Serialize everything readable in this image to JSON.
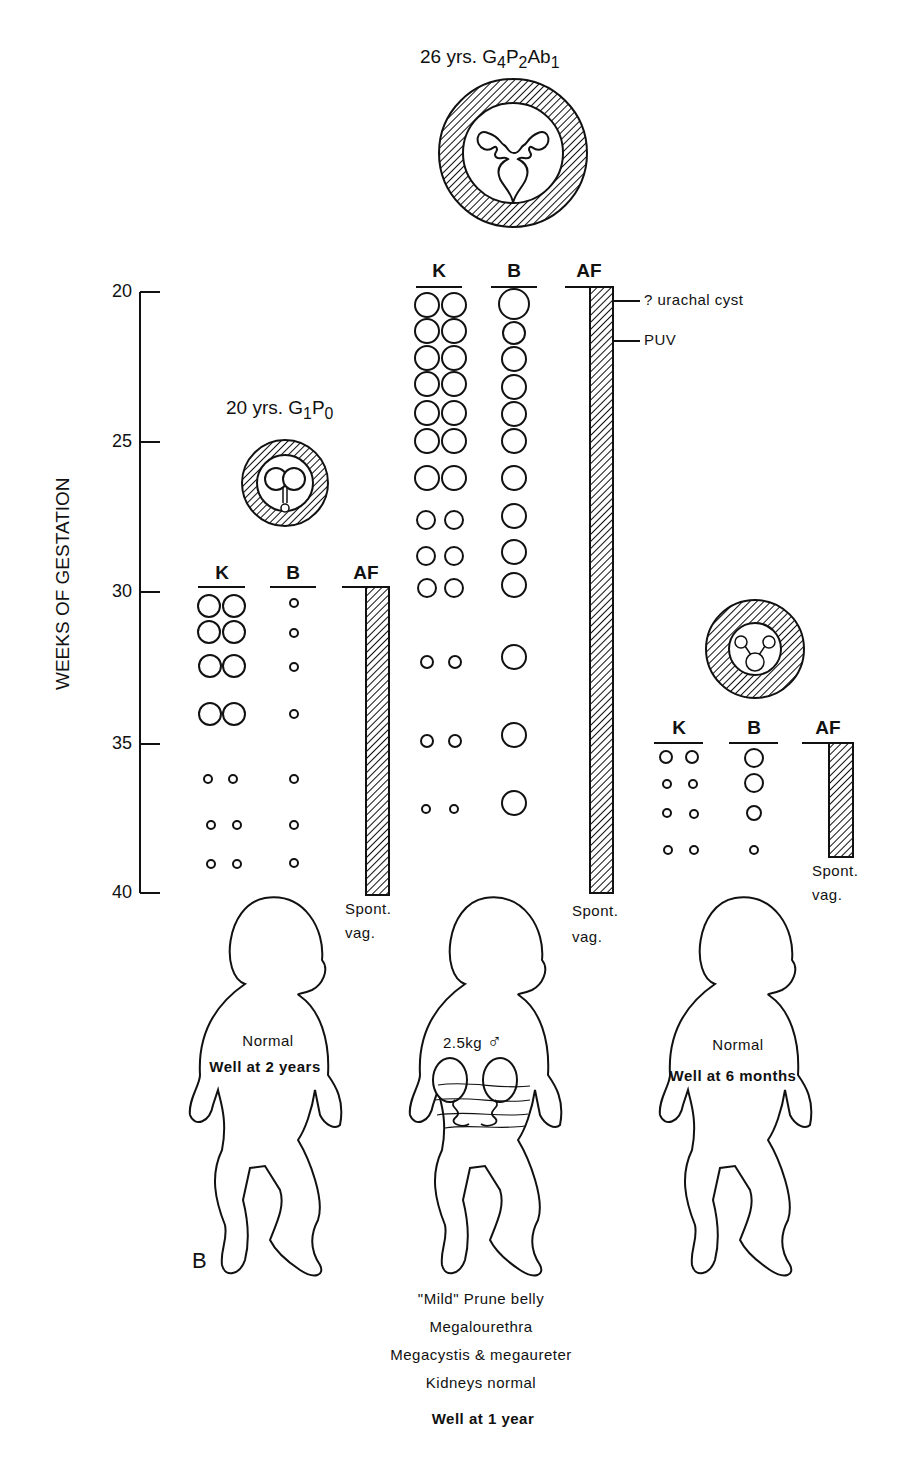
{
  "axis": {
    "title": "WEEKS OF GESTATION",
    "ticks": [
      {
        "label": "20",
        "y": 292
      },
      {
        "label": "25",
        "y": 442
      },
      {
        "label": "30",
        "y": 592
      },
      {
        "label": "35",
        "y": 744
      },
      {
        "label": "40",
        "y": 893
      }
    ]
  },
  "column_headers": {
    "kidney": "K",
    "bladder": "B",
    "amniotic_fluid": "AF"
  },
  "cases": [
    {
      "id": "case1",
      "title_prefix": "20 yrs. ",
      "title_g": "G",
      "g_sub": "1",
      "title_p": "P",
      "p_sub": "0",
      "start_week": 30,
      "delivery": {
        "line1": "Spont.",
        "line2": "vag."
      },
      "outcome_note": "Normal",
      "outcome": "Well at 2 years"
    },
    {
      "id": "case2",
      "title_prefix": "26 yrs. ",
      "title_g": "G",
      "g_sub": "4",
      "title_p": "P",
      "p_sub": "2",
      "title_ab": "Ab",
      "ab_sub": "1",
      "start_week": 20,
      "annotations": [
        "? urachal cyst",
        "PUV"
      ],
      "delivery": {
        "line1": "Spont.",
        "line2": "vag."
      },
      "weight": "2.5kg",
      "sex_symbol": "♂",
      "findings": [
        "\"Mild\" Prune belly",
        "Megalourethra",
        "Megacystis & megaureter",
        "Kidneys normal"
      ],
      "outcome": "Well at 1 year"
    },
    {
      "id": "case3",
      "start_week": 35,
      "delivery": {
        "line1": "Spont.",
        "line2": "vag."
      },
      "outcome_note": "Normal",
      "outcome": "Well at 6 months"
    }
  ],
  "panel_label": "B",
  "colors": {
    "ink": "#111111",
    "background": "#ffffff"
  }
}
